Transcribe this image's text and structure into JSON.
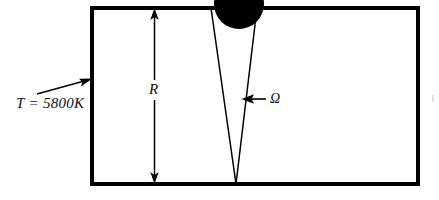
{
  "figure": {
    "type": "physics-schematic",
    "background_color": "#ffffff",
    "stroke_color": "#000000",
    "fill_color": "#000000"
  },
  "labels": {
    "temperature": "T = 5800K",
    "radius": "R",
    "solid_angle": "Ω"
  },
  "geometry": {
    "enclosure": {
      "x": 92,
      "y": 8,
      "width": 326,
      "height": 176,
      "stroke_width": 3.2
    },
    "disk": {
      "center_x": 239,
      "center_y": 4,
      "radius": 25
    },
    "cone": {
      "apex_x": 236,
      "apex_y": 184,
      "top_left_x": 211,
      "top_right_x": 257,
      "top_y": 8,
      "stroke_width": 1.4
    },
    "radius_dimension": {
      "x": 154,
      "top_y": 10,
      "bottom_y": 182,
      "gap_top": 80,
      "gap_bottom": 100,
      "stroke_width": 1.4
    },
    "temperature_leader": {
      "from_x": 36,
      "from_y": 94,
      "to_x": 92,
      "to_y": 79
    },
    "solid_angle_leader": {
      "from_x": 266,
      "from_y": 99,
      "to_x": 243,
      "to_y": 99
    }
  }
}
